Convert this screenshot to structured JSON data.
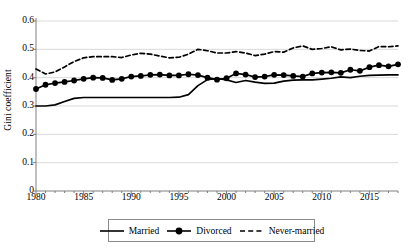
{
  "chart_data": {
    "type": "line",
    "title": "",
    "xlabel": "",
    "ylabel": "Gini coefficient",
    "xlim": [
      1980,
      2018
    ],
    "ylim": [
      0,
      0.6
    ],
    "grid": true,
    "legend_position": "bottom",
    "ytick_labels": [
      "0",
      "0.1",
      "0.2",
      "0.3",
      "0.4",
      "0.5",
      "0.6"
    ],
    "ytick_values": [
      0,
      0.1,
      0.2,
      0.3,
      0.4,
      0.5,
      0.6
    ],
    "xtick_labels": [
      "1980",
      "1985",
      "1990",
      "1995",
      "2000",
      "2005",
      "2010",
      "2015"
    ],
    "xtick_values": [
      1980,
      1985,
      1990,
      1995,
      2000,
      2005,
      2010,
      2015
    ],
    "x": [
      1980,
      1981,
      1982,
      1983,
      1984,
      1985,
      1986,
      1987,
      1988,
      1989,
      1990,
      1991,
      1992,
      1993,
      1994,
      1995,
      1996,
      1997,
      1998,
      1999,
      2000,
      2001,
      2002,
      2003,
      2004,
      2005,
      2006,
      2007,
      2008,
      2009,
      2010,
      2011,
      2012,
      2013,
      2014,
      2015,
      2016,
      2017,
      2018
    ],
    "series": [
      {
        "name": "Married",
        "style": "solid",
        "marker": "none",
        "color": "#000000",
        "values": [
          0.3,
          0.3,
          0.304,
          0.316,
          0.327,
          0.33,
          0.33,
          0.33,
          0.33,
          0.33,
          0.33,
          0.33,
          0.33,
          0.33,
          0.33,
          0.331,
          0.34,
          0.372,
          0.393,
          0.397,
          0.392,
          0.383,
          0.39,
          0.384,
          0.38,
          0.381,
          0.388,
          0.391,
          0.392,
          0.392,
          0.395,
          0.398,
          0.403,
          0.4,
          0.405,
          0.408,
          0.409,
          0.41,
          0.41
        ]
      },
      {
        "name": "Divorced",
        "style": "solid",
        "marker": "circle",
        "color": "#000000",
        "values": [
          0.36,
          0.375,
          0.381,
          0.385,
          0.39,
          0.396,
          0.4,
          0.399,
          0.392,
          0.396,
          0.404,
          0.406,
          0.41,
          0.411,
          0.408,
          0.408,
          0.412,
          0.409,
          0.4,
          0.393,
          0.398,
          0.415,
          0.411,
          0.402,
          0.404,
          0.41,
          0.409,
          0.406,
          0.404,
          0.415,
          0.418,
          0.419,
          0.417,
          0.428,
          0.424,
          0.437,
          0.444,
          0.44,
          0.447
        ]
      },
      {
        "name": "Never-married",
        "style": "dashed",
        "marker": "none",
        "color": "#000000",
        "values": [
          0.431,
          0.413,
          0.42,
          0.438,
          0.457,
          0.47,
          0.474,
          0.474,
          0.474,
          0.471,
          0.48,
          0.486,
          0.483,
          0.476,
          0.47,
          0.472,
          0.483,
          0.5,
          0.495,
          0.487,
          0.487,
          0.492,
          0.487,
          0.478,
          0.483,
          0.492,
          0.49,
          0.505,
          0.512,
          0.5,
          0.503,
          0.509,
          0.498,
          0.501,
          0.496,
          0.494,
          0.51,
          0.509,
          0.512
        ]
      }
    ]
  },
  "legend": {
    "items": [
      {
        "label": "Married",
        "key": "solid-line-key"
      },
      {
        "label": "Divorced",
        "key": "solid-line-marker-key"
      },
      {
        "label": "Never-married",
        "key": "dashed-line-key"
      }
    ]
  }
}
